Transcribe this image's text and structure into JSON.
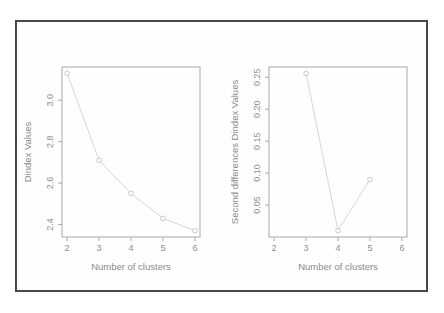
{
  "colors": {
    "background": "#ffffff",
    "frame_border": "#484848",
    "axis": "#a8a8a8",
    "tick_text": "#8e8e8e",
    "label_text": "#8a8a8a",
    "series_line": "#d6d6d6",
    "marker_stroke": "#c7c7c7",
    "marker_fill": "#ffffff"
  },
  "chart_data": [
    {
      "type": "line",
      "title": "",
      "x": [
        2,
        3,
        4,
        5,
        6
      ],
      "values": [
        3.13,
        2.71,
        2.55,
        2.43,
        2.37
      ],
      "xlabel": "Number of clusters",
      "ylabel": "Dindex Values",
      "xlim": [
        1.84,
        6.16
      ],
      "ylim": [
        2.34,
        3.16
      ],
      "xticks": [
        2,
        3,
        4,
        5,
        6
      ],
      "xtick_labels": [
        "2",
        "3",
        "4",
        "5",
        "6"
      ],
      "yticks": [
        2.4,
        2.6,
        2.8,
        3.0
      ],
      "ytick_labels": [
        "2.4",
        "2.6",
        "2.8",
        "3.0"
      ],
      "marker": "open-circle",
      "grid": false,
      "legend": "none"
    },
    {
      "type": "line",
      "title": "",
      "x": [
        3,
        4,
        5
      ],
      "values": [
        0.256,
        0.01,
        0.09
      ],
      "xlabel": "Number of clusters",
      "ylabel": "Second differences Dindex Values",
      "xlim": [
        1.84,
        6.16
      ],
      "ylim": [
        0.0,
        0.266
      ],
      "xticks": [
        2,
        3,
        4,
        5,
        6
      ],
      "xtick_labels": [
        "2",
        "3",
        "4",
        "5",
        "6"
      ],
      "yticks": [
        0.05,
        0.1,
        0.15,
        0.2,
        0.25
      ],
      "ytick_labels": [
        "0.05",
        "0.10",
        "0.15",
        "0.20",
        "0.25"
      ],
      "marker": "open-circle",
      "grid": false,
      "legend": "none"
    }
  ]
}
